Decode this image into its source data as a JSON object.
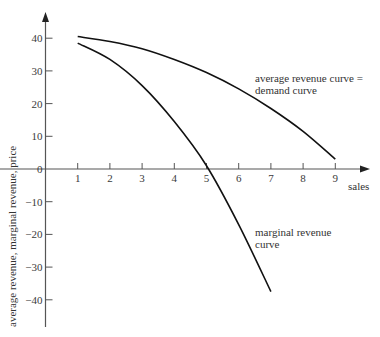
{
  "chart_data": {
    "type": "line",
    "title": "",
    "xlabel": "sales",
    "ylabel": "average revenue, marginal revenue, price",
    "xlim": [
      0,
      10
    ],
    "ylim": [
      -48,
      50
    ],
    "x_ticks": [
      1,
      2,
      3,
      4,
      5,
      6,
      7,
      8,
      9
    ],
    "y_ticks": [
      40,
      30,
      20,
      10,
      0,
      -10,
      -20,
      -30,
      -40
    ],
    "grid": false,
    "legend": null,
    "series": [
      {
        "name": "average revenue curve = demand curve",
        "x": [
          1,
          2,
          3,
          4,
          5,
          6,
          7,
          8,
          9
        ],
        "values": [
          40.5,
          39,
          36.8,
          33.5,
          29.5,
          24.5,
          18.5,
          11.5,
          3
        ]
      },
      {
        "name": "marginal revenue curve",
        "x": [
          1,
          2,
          3,
          4,
          5,
          6,
          7
        ],
        "values": [
          38.5,
          33.5,
          25.5,
          14.5,
          1,
          -17,
          -37.5
        ]
      }
    ],
    "annotations": [
      {
        "text": "average revenue curve =",
        "line": 1,
        "target": "average revenue curve"
      },
      {
        "text": "demand curve",
        "line": 2,
        "target": "average revenue curve"
      },
      {
        "text": "marginal revenue",
        "line": 1,
        "target": "marginal revenue curve"
      },
      {
        "text": "curve",
        "line": 2,
        "target": "marginal revenue curve"
      }
    ]
  },
  "labels": {
    "x_axis": "sales",
    "y_axis": "average revenue, marginal revenue, price",
    "ar_line1": "average revenue curve =",
    "ar_line2": "demand curve",
    "mr_line1": "marginal revenue",
    "mr_line2": "curve"
  },
  "colors": {
    "axis": "#555555",
    "curve": "#111111",
    "text": "#333333"
  }
}
